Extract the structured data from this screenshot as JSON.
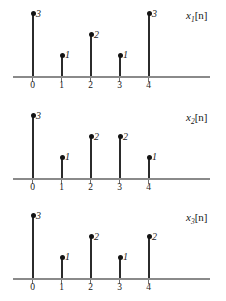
{
  "figure": {
    "width": 226,
    "height": 301,
    "background": "#ffffff",
    "stem_color": "#2b2b2b",
    "dot_color": "#141414",
    "axis_color": "#8a8a8a",
    "text_color": "#1a1a1a"
  },
  "chart_data": [
    {
      "type": "bar",
      "style": "stem",
      "title": "x1[n]",
      "label_base": "x",
      "label_subscript": "1",
      "label_bracket": "[n]",
      "xlabel": "n",
      "ylabel": "",
      "categories": [
        "0",
        "1",
        "2",
        "3",
        "4"
      ],
      "x": [
        0,
        1,
        2,
        3,
        4
      ],
      "values": [
        3,
        1,
        2,
        1,
        3
      ],
      "value_labels": [
        "3",
        "1",
        "2",
        "1",
        "3"
      ],
      "xlim": [
        -0.7,
        6.2
      ],
      "ylim": [
        0,
        3.2
      ],
      "grid": false,
      "legend": "none"
    },
    {
      "type": "bar",
      "style": "stem",
      "title": "x2[n]",
      "label_base": "x",
      "label_subscript": "2",
      "label_bracket": "[n]",
      "xlabel": "n",
      "ylabel": "",
      "categories": [
        "0",
        "1",
        "2",
        "3",
        "4"
      ],
      "x": [
        0,
        1,
        2,
        3,
        4
      ],
      "values": [
        3,
        1,
        2,
        2,
        1
      ],
      "value_labels": [
        "3",
        "1",
        "2",
        "2",
        "1"
      ],
      "xlim": [
        -0.7,
        6.2
      ],
      "ylim": [
        0,
        3.2
      ],
      "grid": false,
      "legend": "none"
    },
    {
      "type": "bar",
      "style": "stem",
      "title": "x3[n]",
      "label_base": "x",
      "label_subscript": "3",
      "label_bracket": "[n]",
      "xlabel": "n",
      "ylabel": "",
      "categories": [
        "0",
        "1",
        "2",
        "3",
        "4"
      ],
      "x": [
        0,
        1,
        2,
        3,
        4
      ],
      "values": [
        3,
        1,
        2,
        1,
        2
      ],
      "value_labels": [
        "3",
        "1",
        "2",
        "1",
        "2"
      ],
      "xlim": [
        -0.7,
        6.2
      ],
      "ylim": [
        0,
        3.2
      ],
      "grid": false,
      "legend": "none"
    }
  ],
  "panels": [
    {
      "name": "x1",
      "baseline_y": 76,
      "axis_left": 13,
      "axis_right": 210,
      "unit_px": 20.7,
      "first_stem_x": 32,
      "stem_spacing": 29,
      "signal_label_x": 186,
      "signal_label_y": 10
    },
    {
      "name": "x2",
      "baseline_y": 178,
      "axis_left": 13,
      "axis_right": 210,
      "unit_px": 20.7,
      "first_stem_x": 32,
      "stem_spacing": 29,
      "signal_label_x": 186,
      "signal_label_y": 112
    },
    {
      "name": "x3",
      "baseline_y": 278,
      "axis_left": 13,
      "axis_right": 210,
      "unit_px": 20.7,
      "first_stem_x": 32,
      "stem_spacing": 29,
      "signal_label_x": 186,
      "signal_label_y": 212
    }
  ]
}
